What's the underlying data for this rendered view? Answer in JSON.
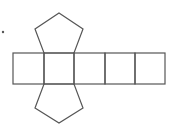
{
  "diagram": {
    "stroke_color": "#555555",
    "background": "#ffffff",
    "marker_dot": {
      "x": 3,
      "y": 32
    },
    "faces": {
      "top_pentagon": "59,13 83,29 74,53 44,53 35,29",
      "bottom_pentagon": "44,84 74,84 83,108 59,123 35,108",
      "rectangles": [
        {
          "x": 13,
          "y": 53,
          "w": 31,
          "h": 31
        },
        {
          "x": 44,
          "y": 53,
          "w": 30,
          "h": 31
        },
        {
          "x": 74,
          "y": 53,
          "w": 31,
          "h": 31
        },
        {
          "x": 105,
          "y": 53,
          "w": 30,
          "h": 31
        },
        {
          "x": 135,
          "y": 53,
          "w": 30,
          "h": 31
        }
      ]
    }
  }
}
